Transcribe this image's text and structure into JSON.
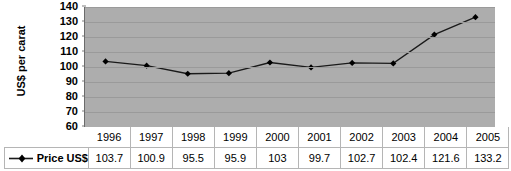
{
  "chart_data": {
    "type": "line",
    "title": "",
    "xlabel": "",
    "ylabel": "US$ per carat",
    "categories": [
      "1996",
      "1997",
      "1998",
      "1999",
      "2000",
      "2001",
      "2002",
      "2003",
      "2004",
      "2005"
    ],
    "series": [
      {
        "name": "Price US$",
        "values": [
          103.7,
          100.9,
          95.5,
          95.9,
          103,
          99.7,
          102.7,
          102.4,
          121.6,
          133.2
        ]
      }
    ],
    "value_labels": [
      "103.7",
      "100.9",
      "95.5",
      "95.9",
      "103",
      "99.7",
      "102.7",
      "102.4",
      "121.6",
      "133.2"
    ],
    "ylim": [
      60,
      140
    ],
    "ytick_values": [
      140,
      130,
      120,
      110,
      100,
      90,
      80,
      70,
      60
    ],
    "ytick_labels": [
      "140",
      "130",
      "120",
      "110",
      "100",
      "90",
      "80",
      "70",
      "60"
    ],
    "grid": true,
    "legend_position": "data-table-row",
    "marker": "diamond",
    "line_color": "#1a1a1a",
    "marker_color": "#000000",
    "plot_background": "#adadad",
    "gridline_color": "#9a9a9a"
  },
  "data_table": {
    "header_blank": "",
    "legend_series_label": "Price US$",
    "year_headers": [
      "1996",
      "1997",
      "1998",
      "1999",
      "2000",
      "2001",
      "2002",
      "2003",
      "2004",
      "2005"
    ],
    "value_cells": [
      "103.7",
      "100.9",
      "95.5",
      "95.9",
      "103",
      "99.7",
      "102.7",
      "102.4",
      "121.6",
      "133.2"
    ]
  }
}
